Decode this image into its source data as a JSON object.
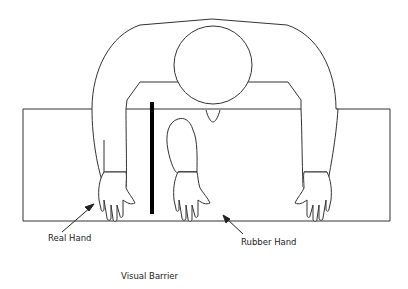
{
  "diagram": {
    "labels": {
      "real_hand": "Real Hand",
      "rubber_hand": "Rubber Hand",
      "visual_barrier": "Visual Barrier"
    },
    "colors": {
      "stroke": "#333333",
      "barrier": "#000000",
      "background": "#ffffff"
    }
  }
}
